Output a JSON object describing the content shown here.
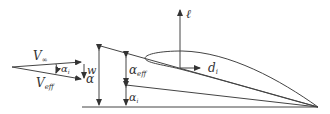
{
  "diagram": {
    "type": "induced-drag-airfoil-geometry",
    "colors": {
      "stroke": "#444444",
      "text": "#333333",
      "background": "#ffffff"
    },
    "velocity_triangle": {
      "v_inf": {
        "symbol": "V",
        "subscript": "∞"
      },
      "v_eff": {
        "symbol": "V",
        "subscript": "eff"
      },
      "alpha_i": {
        "symbol": "α",
        "subscript": "i"
      },
      "downwash": {
        "symbol": "w"
      }
    },
    "angles": {
      "alpha": {
        "symbol": "α"
      },
      "alpha_eff": {
        "symbol": "α",
        "subscript": "eff"
      },
      "alpha_i": {
        "symbol": "α",
        "subscript": "i"
      }
    },
    "forces": {
      "lift": {
        "symbol": "ℓ"
      },
      "induced_drag": {
        "symbol": "d",
        "subscript": "i"
      }
    }
  }
}
